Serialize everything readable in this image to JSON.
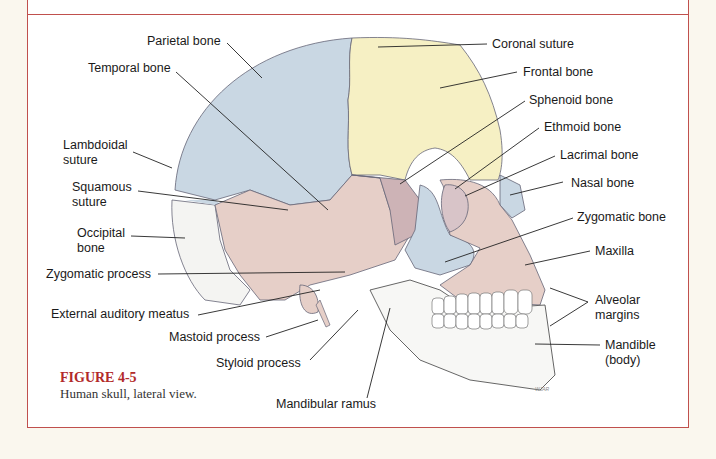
{
  "figure": {
    "number": "FIGURE 4-5",
    "caption": "Human skull, lateral view.",
    "artist_signature": "WJAR"
  },
  "labels": {
    "parietal_bone": "Parietal bone",
    "temporal_bone": "Temporal bone",
    "lambdoidal_suture_1": "Lambdoidal",
    "lambdoidal_suture_2": "suture",
    "squamous_suture_1": "Squamous",
    "squamous_suture_2": "suture",
    "occipital_bone_1": "Occipital",
    "occipital_bone_2": "bone",
    "zygomatic_process": "Zygomatic process",
    "external_auditory_meatus": "External auditory meatus",
    "mastoid_process": "Mastoid process",
    "styloid_process": "Styloid process",
    "mandibular_ramus": "Mandibular ramus",
    "coronal_suture": "Coronal suture",
    "frontal_bone": "Frontal bone",
    "sphenoid_bone": "Sphenoid bone",
    "ethmoid_bone": "Ethmoid bone",
    "lacrimal_bone": "Lacrimal bone",
    "nasal_bone": "Nasal bone",
    "zygomatic_bone": "Zygomatic bone",
    "maxilla": "Maxilla",
    "alveolar_margins_1": "Alveolar",
    "alveolar_margins_2": "margins",
    "mandible_body_1": "Mandible",
    "mandible_body_2": "(body)"
  },
  "colors": {
    "frame_red": "#c0504d",
    "figure_title_red": "#b22a2a",
    "parietal_blue": "#c9d7e3",
    "frontal_yellow": "#f6f0c4",
    "temporal_pink": "#e6cfc8",
    "sphenoid_mauve": "#cdb3b6",
    "mandible_white": "#f7f7f5",
    "page_background": "#faf7ee"
  }
}
